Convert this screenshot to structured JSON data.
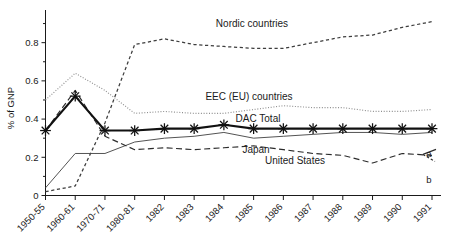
{
  "chart_data": {
    "type": "line",
    "title": "",
    "xlabel": "",
    "ylabel": "% of GNP",
    "ylim": [
      0,
      0.95
    ],
    "yticks": [
      0,
      0.2,
      0.4,
      0.6,
      0.8
    ],
    "ytick_labels": [
      "0",
      "0.2",
      "0.4",
      "0.6",
      "0.8"
    ],
    "yminor": [
      0.1,
      0.3,
      0.5,
      0.7,
      0.9
    ],
    "grid": false,
    "legend_position": "inline-annotations",
    "categories": [
      "1950-55",
      "1960-61",
      "1970-71",
      "1980-81",
      "1982",
      "1983",
      "1984",
      "1985",
      "1986",
      "1987",
      "1988",
      "1989",
      "1990",
      "1991"
    ],
    "series": [
      {
        "name": "Nordic countries",
        "style": "dashed",
        "color": "#3d3d3d",
        "label_x": 252,
        "label_y": 27,
        "values": [
          0.02,
          0.05,
          0.38,
          0.79,
          0.82,
          0.79,
          0.78,
          0.77,
          0.77,
          0.8,
          0.83,
          0.84,
          0.88,
          0.91
        ]
      },
      {
        "name": "EEC (EU) countries",
        "style": "dotted",
        "color": "#8e8e8e",
        "label_x": 249,
        "label_y": 100,
        "values": [
          0.5,
          0.64,
          0.55,
          0.43,
          0.44,
          0.43,
          0.43,
          0.45,
          0.47,
          0.46,
          0.46,
          0.44,
          0.44,
          0.45
        ]
      },
      {
        "name": "DAC Total",
        "style": "solid-thick-star",
        "color": "#111111",
        "label_x": 258,
        "label_y": 122,
        "values": [
          0.34,
          0.52,
          0.34,
          0.34,
          0.35,
          0.35,
          0.37,
          0.35,
          0.35,
          0.35,
          0.35,
          0.35,
          0.35,
          0.35
        ]
      },
      {
        "name": "Japan",
        "style": "solid-thin",
        "color": "#4a4a4a",
        "label_x": 256,
        "label_y": 153,
        "values": [
          0.04,
          0.22,
          0.22,
          0.28,
          0.3,
          0.31,
          0.33,
          0.3,
          0.31,
          0.32,
          0.33,
          0.33,
          0.32,
          0.33
        ]
      },
      {
        "name": "United States",
        "style": "long-dashed",
        "color": "#2b2b2b",
        "label_x": 295,
        "label_y": 164,
        "values": [
          0.34,
          0.55,
          0.31,
          0.24,
          0.25,
          0.24,
          0.25,
          0.26,
          0.24,
          0.22,
          0.21,
          0.17,
          0.22,
          0.21
        ]
      }
    ],
    "annotations": [
      {
        "text": "a",
        "x": 429,
        "y": 157
      },
      {
        "text": "b",
        "x": 429,
        "y": 183
      }
    ]
  }
}
